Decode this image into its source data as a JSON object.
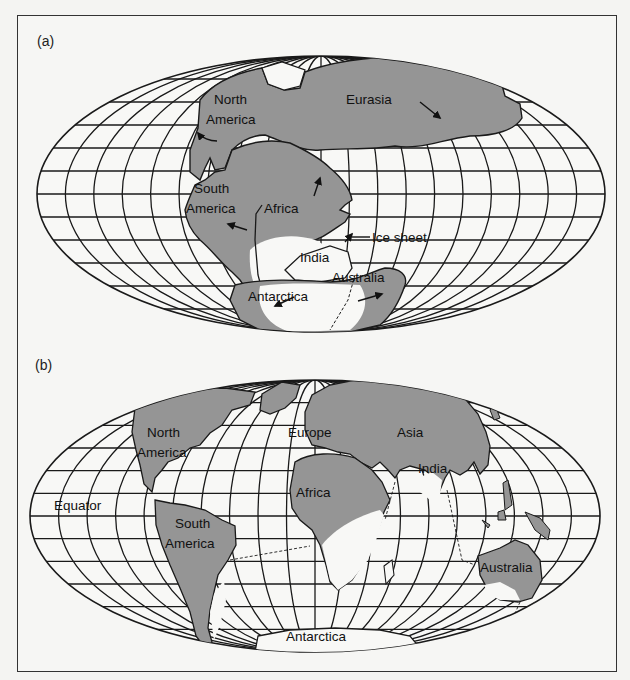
{
  "figure": {
    "panels": [
      {
        "id": "a",
        "label": "(a)",
        "title": "Gondwana / Pangaea reconstruction with ice sheet",
        "labels": {
          "north_america": [
            "North",
            "America"
          ],
          "eurasia": "Eurasia",
          "south_america": [
            "South",
            "America"
          ],
          "africa": "Africa",
          "ice_sheet": "Ice sheet",
          "india": "India",
          "australia": "Australia",
          "antarctica": "Antarctica"
        }
      },
      {
        "id": "b",
        "label": "(b)",
        "title": "Present-day continents with former glaciated areas",
        "labels": {
          "north_america": [
            "North",
            "America"
          ],
          "europe": "Europe",
          "asia": "Asia",
          "india": "India",
          "equator": "Equator",
          "africa": "Africa",
          "south_america": [
            "South",
            "America"
          ],
          "australia": "Australia",
          "antarctica": "Antarctica"
        }
      }
    ],
    "colors": {
      "land": "#959595",
      "ice": "#f8f8f6",
      "grid": "#1a1a1a",
      "background": "#f6f6f4"
    }
  }
}
